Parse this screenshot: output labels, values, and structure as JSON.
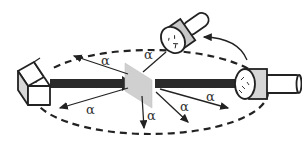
{
  "diagram": {
    "type": "scattering-experiment-setup",
    "colors": {
      "line": "#222222",
      "beam": "#2a2a2a",
      "foil": "#cfcfcf",
      "detector_ring": "#c8c8c8",
      "source_side": "#d8d8d8",
      "background": "#ffffff"
    },
    "labels": {
      "alpha_1": "α",
      "alpha_2": "α",
      "alpha_3": "α",
      "alpha_4": "α",
      "alpha_5": "α",
      "alpha_6": "α"
    },
    "components": [
      "source-box",
      "incident-beam",
      "target-foil",
      "transmitted-beam",
      "detector-fixed",
      "detector-movable",
      "dashed-orbit",
      "rotation-arrow",
      "scattered-rays"
    ]
  }
}
